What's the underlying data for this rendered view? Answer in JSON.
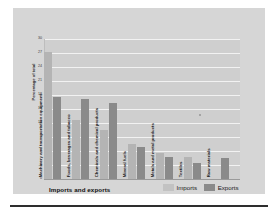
{
  "figure": {
    "background_color": "#d6d6d6",
    "plot_background_color": "#cfcfcf",
    "gridline_color": "#f2f2f2"
  },
  "axis": {
    "y_title": "Percentage of total",
    "x_title": "Imports and exports"
  },
  "legend": {
    "items": [
      {
        "label": "Imports",
        "color": "#c2c2c2"
      },
      {
        "label": "Exports",
        "color": "#8a8a8a"
      }
    ]
  },
  "chart_data": {
    "type": "bar",
    "title": "",
    "subtitle": "",
    "xlabel": "Imports and exports",
    "ylabel": "Percentage of total",
    "ylim": [
      0,
      30
    ],
    "yticks": [
      30,
      27,
      24,
      21,
      18,
      15,
      12,
      9,
      6,
      3,
      0
    ],
    "ytick_labels": [
      "30",
      "27",
      "24",
      "21",
      "18",
      "15",
      "12",
      "9",
      "6",
      "3",
      "0"
    ],
    "grid": true,
    "grid_axis": "y",
    "legend_position": "bottom-right",
    "orientation": "vertical",
    "categories": [
      "Machinery and transportation equipment",
      "Foods, beverages and tobacco",
      "Chemicals and chemical products",
      "Mineral fuels",
      "Metals and metal products",
      "Textiles",
      "Raw materials"
    ],
    "series": [
      {
        "name": "Imports",
        "color": "#b4b4b4",
        "values": [
          27.3,
          12.6,
          10.5,
          7.5,
          5.6,
          4.7,
          0
        ]
      },
      {
        "name": "Exports",
        "color": "#8a8a8a",
        "values": [
          17.5,
          17.1,
          16.2,
          6.8,
          4.8,
          3.5,
          4.5
        ]
      }
    ]
  }
}
